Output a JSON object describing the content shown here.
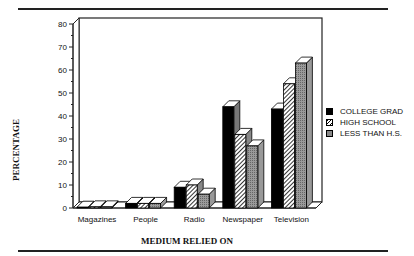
{
  "chart_data": {
    "type": "bar",
    "style": "3d-clustered",
    "title": "",
    "xlabel": "MEDIUM RELIED ON",
    "ylabel": "PERCENTAGE",
    "ylim": [
      0,
      80
    ],
    "yticks": [
      0,
      10,
      20,
      30,
      40,
      50,
      60,
      70,
      80
    ],
    "categories": [
      "Magazines",
      "People",
      "Radio",
      "Newspaper",
      "Television"
    ],
    "series": [
      {
        "name": "COLLEGE GRAD",
        "pattern": "solid-black",
        "values": [
          0,
          2,
          9,
          44,
          43
        ]
      },
      {
        "name": "HIGH SCHOOL",
        "pattern": "hatched",
        "values": [
          0.5,
          2,
          10,
          32,
          54
        ]
      },
      {
        "name": "LESS THAN H.S.",
        "pattern": "gray-dotted",
        "values": [
          0.5,
          2,
          6,
          27,
          63
        ]
      }
    ],
    "legend_position": "right",
    "grid": false
  },
  "labels": {
    "xlabel": "MEDIUM RELIED ON",
    "ylabel": "PERCENTAGE",
    "legend": [
      "COLLEGE GRAD",
      "HIGH SCHOOL",
      "LESS THAN H.S."
    ]
  }
}
